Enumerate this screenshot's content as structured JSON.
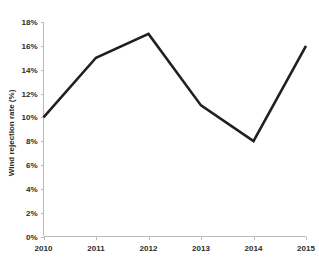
{
  "chart_data": {
    "type": "line",
    "title": "",
    "xlabel": "",
    "ylabel": "Wind rejection rate (%)",
    "categories": [
      "2010",
      "2011",
      "2012",
      "2013",
      "2014",
      "2015"
    ],
    "x": [
      2010,
      2011,
      2012,
      2013,
      2014,
      2015
    ],
    "values": [
      10,
      15,
      17,
      11,
      8,
      16
    ],
    "series": [
      {
        "name": "Wind rejection rate",
        "values": [
          10,
          15,
          17,
          11,
          8,
          16
        ],
        "color": "#231f20"
      }
    ],
    "ylim": [
      0,
      18
    ],
    "ytick_step": 2,
    "ytick_labels": [
      "0%",
      "2%",
      "4%",
      "6%",
      "8%",
      "10%",
      "12%",
      "14%",
      "16%",
      "18%"
    ],
    "ytick_values": [
      0,
      2,
      4,
      6,
      8,
      10,
      12,
      14,
      16,
      18
    ],
    "xtick_labels": [
      "2010",
      "2011",
      "2012",
      "2013",
      "2014",
      "2015"
    ],
    "grid": false,
    "legend": false,
    "markers": false,
    "axis_color": "#b9b9b9",
    "line_color": "#231f20",
    "background": "#ffffff"
  }
}
